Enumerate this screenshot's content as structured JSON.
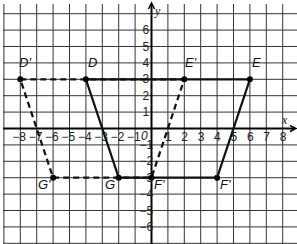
{
  "graph": {
    "x_range": [
      -9,
      9
    ],
    "y_range": [
      -7,
      7
    ],
    "x_axis_label": "x",
    "y_axis_label": "y",
    "origin_label": "0",
    "x_ticks": [
      "-8",
      "-7",
      "-6",
      "-5",
      "-4",
      "-3",
      "-2",
      "-1",
      "1",
      "2",
      "3",
      "4",
      "5",
      "6",
      "7",
      "8"
    ],
    "y_ticks": [
      "6",
      "5",
      "4",
      "3",
      "2",
      "1",
      "-1",
      "-2",
      "-3",
      "-4",
      "-5",
      "-6"
    ],
    "grid_color": "#333333",
    "line_color": "#111111"
  },
  "figures": {
    "original": {
      "style": "solid",
      "vertices": [
        {
          "label": "D",
          "x": -4,
          "y": 3
        },
        {
          "label": "E",
          "x": 6,
          "y": 3
        },
        {
          "label": "F'",
          "x": 4,
          "y": -3
        },
        {
          "label": "G",
          "x": -2,
          "y": -3
        }
      ]
    },
    "image": {
      "style": "dashed",
      "vertices": [
        {
          "label": "D'",
          "x": -8,
          "y": 3
        },
        {
          "label": "E'",
          "x": 2,
          "y": 3
        },
        {
          "label": "F'",
          "x": 0,
          "y": -3
        },
        {
          "label": "G'",
          "x": -6,
          "y": -3
        }
      ]
    }
  },
  "labels": {
    "D": "D",
    "E": "E",
    "F": "F'",
    "G": "G",
    "D_prime": "D'",
    "E_prime": "E'",
    "F_prime": "F'",
    "G_prime": "G'"
  }
}
